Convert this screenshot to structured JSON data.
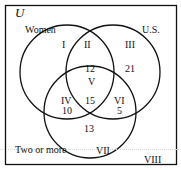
{
  "diagram": {
    "type": "venn",
    "universe_label": "U",
    "sets": [
      {
        "name": "Women",
        "label": "Women"
      },
      {
        "name": "U.S.",
        "label": "U.S."
      },
      {
        "name": "Two or more",
        "label": "Two or more"
      }
    ],
    "regions": [
      {
        "id": "I",
        "numeral": "I",
        "value": null
      },
      {
        "id": "II",
        "numeral": "II",
        "value": "12"
      },
      {
        "id": "III",
        "numeral": "III",
        "value": "21"
      },
      {
        "id": "IV",
        "numeral": "IV",
        "value": "10"
      },
      {
        "id": "V",
        "numeral": "V",
        "value": "15"
      },
      {
        "id": "VI",
        "numeral": "VI",
        "value": "5"
      },
      {
        "id": "VII",
        "numeral": "VII",
        "value": "13"
      },
      {
        "id": "VIII",
        "numeral": "VIII",
        "value": null
      }
    ],
    "colors": {
      "stroke": "#111111",
      "background": "#ffffff"
    }
  }
}
